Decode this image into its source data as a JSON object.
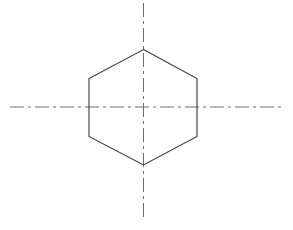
{
  "drawing": {
    "title": "Hexagon with centerlines",
    "type": "orthographic-technical-drawing",
    "canvas": {
      "width": 293,
      "height": 230,
      "background_color": "#ffffff"
    },
    "shape": {
      "name": "regular-hexagon",
      "label": "Hexagon outline",
      "orientation": "flat-left-right-vertices",
      "center": {
        "x": 143.5,
        "y": 107
      },
      "width": 108,
      "height": 115,
      "stroke_color": "#3a3a3a",
      "stroke_width": 1.1,
      "fill": "none",
      "vertices": [
        {
          "name": "top",
          "x": 143.5,
          "y": 49.5
        },
        {
          "name": "upper-right",
          "x": 197,
          "y": 78.5
        },
        {
          "name": "lower-right",
          "x": 197,
          "y": 136.5
        },
        {
          "name": "bottom",
          "x": 143.5,
          "y": 165
        },
        {
          "name": "lower-left",
          "x": 89,
          "y": 136.5
        },
        {
          "name": "upper-left",
          "x": 89,
          "y": 78.5
        }
      ]
    },
    "centerlines": [
      {
        "name": "horizontal-centerline",
        "label": "Horizontal centerline",
        "orientation": "horizontal",
        "x1": 10,
        "y1": 107,
        "x2": 285,
        "y2": 107,
        "stroke_color": "#6d6d6d",
        "stroke_width": 1,
        "dash_pattern": "14,4,3,4"
      },
      {
        "name": "vertical-centerline",
        "label": "Vertical centerline",
        "orientation": "vertical",
        "x1": 143.5,
        "y1": 3,
        "x2": 143.5,
        "y2": 219,
        "stroke_color": "#6d6d6d",
        "stroke_width": 1,
        "dash_pattern": "14,4,3,4"
      }
    ]
  },
  "chart_data": {
    "type": "diagram",
    "xlabel": "",
    "ylabel": "",
    "series": [
      {
        "name": "hexagon-outline",
        "x": [
          143.5,
          197,
          197,
          143.5,
          89,
          89,
          143.5
        ],
        "y": [
          49.5,
          78.5,
          136.5,
          165,
          136.5,
          78.5,
          49.5
        ]
      },
      {
        "name": "horizontal-centerline",
        "x": [
          10,
          285
        ],
        "y": [
          107,
          107
        ]
      },
      {
        "name": "vertical-centerline",
        "x": [
          143.5,
          143.5
        ],
        "y": [
          3,
          219
        ]
      }
    ]
  }
}
